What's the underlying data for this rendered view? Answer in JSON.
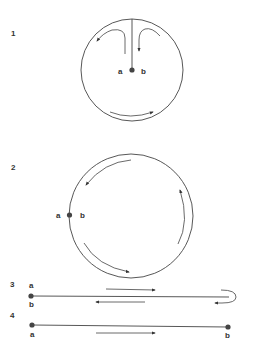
{
  "panels": [
    {
      "number": "1",
      "point_labels": {
        "a": "a",
        "b": "b"
      },
      "description": "Circle with a radial cut from top to center point a/b; arrows circulate around the interior"
    },
    {
      "number": "2",
      "point_labels": {
        "a": "a",
        "b": "b"
      },
      "description": "Circle with point a/b on left edge; arrows circulate counterclockwise inside"
    },
    {
      "number": "3",
      "point_labels": {
        "a": "a",
        "b": "b"
      },
      "description": "Folded line with both a and b at left end; arrow goes right then loops back left"
    },
    {
      "number": "4",
      "point_labels": {
        "a": "a",
        "b": "b"
      },
      "description": "Straight line from a (left) to b (right); arrow pointing right"
    }
  ],
  "colors": {
    "stroke": "#444444",
    "text": "#333333",
    "background": "#ffffff"
  }
}
